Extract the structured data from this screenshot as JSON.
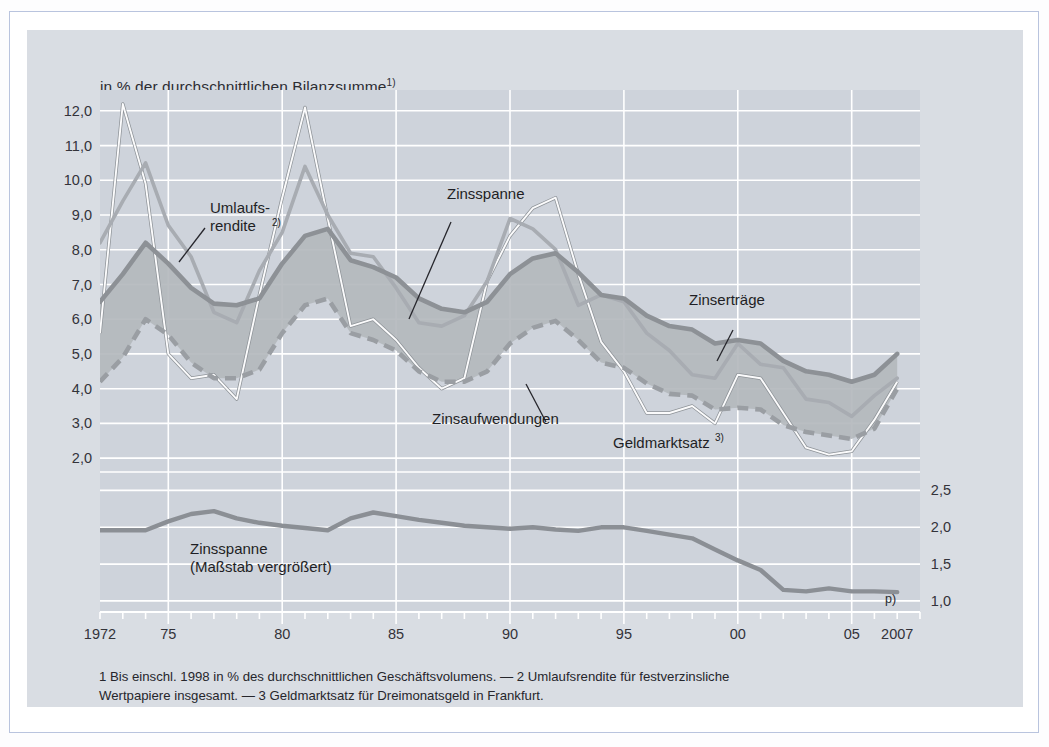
{
  "figure": {
    "title": "in % der durchschnittlichen Bilanzsumme",
    "title_sup": "1)",
    "p_flag": "p)",
    "footnote_line1": "1  Bis einschl. 1998 in % des durchschnittlichen Geschäftsvolumens. — 2 Umlaufsrendite für festverzinsliche",
    "footnote_line2": "Wertpapiere insgesamt. — 3 Geldmarktsatz für Dreimonatsgeld in Frankfurt.",
    "colors": {
      "panel_background": "#d9dde3",
      "plot_background": "#ced3db",
      "grid": "#ffffff",
      "band_fill": "#b4b8bd",
      "zinsertraege": "#8d9196",
      "zinsaufwendungen": "#9a9ea3",
      "umlaufsrendite": "#a8acb2",
      "geldmarktsatz": "#fbfbfc",
      "zinsspanne_lower": "#8b8f95",
      "text": "#26262c",
      "frame": "#b9c4de"
    }
  },
  "annotations": [
    {
      "name": "umlaufsrendite",
      "line1": "Umlaufs-",
      "line2": "rendite",
      "sup": "2)"
    },
    {
      "name": "zinsspanne",
      "label": "Zinsspanne"
    },
    {
      "name": "zinsertraege",
      "label": "Zinserträge"
    },
    {
      "name": "zinsaufwendungen",
      "label": "Zinsaufwendungen"
    },
    {
      "name": "geldmarktsatz",
      "label": "Geldmarktsatz",
      "sup": "3)"
    },
    {
      "name": "zinsspanne-lower",
      "line1": "Zinsspanne",
      "line2": "(Maßstab vergrößert)"
    }
  ],
  "chart_data": {
    "type": "line",
    "xlabel": "",
    "ylabel": "in % der durchschnittlichen Bilanzsumme",
    "grid": true,
    "legend_position": "inline-annotations",
    "xlim": [
      1972,
      2007
    ],
    "ylim": [
      1.6,
      12.6
    ],
    "ylim_right": [
      0.85,
      2.75
    ],
    "x_tick_labels": [
      {
        "x": 1972,
        "label": "1972"
      },
      {
        "x": 1975,
        "label": "75"
      },
      {
        "x": 1980,
        "label": "80"
      },
      {
        "x": 1985,
        "label": "85"
      },
      {
        "x": 1990,
        "label": "90"
      },
      {
        "x": 1995,
        "label": "95"
      },
      {
        "x": 2000,
        "label": "00"
      },
      {
        "x": 2005,
        "label": "05"
      },
      {
        "x": 2007,
        "label": "2007"
      }
    ],
    "y_tick_labels": [
      "12,0",
      "11,0",
      "10,0",
      "9,0",
      "8,0",
      "7,0",
      "6,0",
      "5,0",
      "4,0",
      "3,0",
      "2,0"
    ],
    "y_ticks": [
      12.0,
      11.0,
      10.0,
      9.0,
      8.0,
      7.0,
      6.0,
      5.0,
      4.0,
      3.0,
      2.0
    ],
    "y_right_tick_labels": [
      "2,5",
      "2,0",
      "1,5",
      "1,0"
    ],
    "y_right_ticks": [
      2.5,
      2.0,
      1.5,
      1.0
    ],
    "x": [
      1972,
      1973,
      1974,
      1975,
      1976,
      1977,
      1978,
      1979,
      1980,
      1981,
      1982,
      1983,
      1984,
      1985,
      1986,
      1987,
      1988,
      1989,
      1990,
      1991,
      1992,
      1993,
      1994,
      1995,
      1996,
      1997,
      1998,
      1999,
      2000,
      2001,
      2002,
      2003,
      2004,
      2005,
      2006,
      2007
    ],
    "series": [
      {
        "name": "Zinserträge",
        "style": "solid-thick",
        "color": "#8d9196",
        "values": [
          6.5,
          7.3,
          8.2,
          7.6,
          6.9,
          6.45,
          6.4,
          6.6,
          7.6,
          8.4,
          8.6,
          7.7,
          7.5,
          7.2,
          6.6,
          6.3,
          6.2,
          6.5,
          7.3,
          7.75,
          7.9,
          7.35,
          6.7,
          6.6,
          6.1,
          5.8,
          5.7,
          5.3,
          5.4,
          5.3,
          4.8,
          4.5,
          4.4,
          4.2,
          4.4,
          5.0
        ]
      },
      {
        "name": "Zinsaufwendungen",
        "style": "dashed-thick",
        "color": "#9a9ea3",
        "values": [
          4.2,
          4.9,
          6.0,
          5.55,
          4.75,
          4.3,
          4.3,
          4.55,
          5.6,
          6.4,
          6.6,
          5.6,
          5.4,
          5.1,
          4.5,
          4.2,
          4.2,
          4.5,
          5.3,
          5.75,
          5.95,
          5.4,
          4.75,
          4.6,
          4.15,
          3.85,
          3.8,
          3.4,
          3.45,
          3.4,
          2.95,
          2.75,
          2.65,
          2.55,
          2.85,
          4.0
        ]
      },
      {
        "name": "Umlaufsrendite",
        "style": "solid-medium",
        "color": "#a8acb2",
        "values": [
          8.2,
          9.4,
          10.5,
          8.7,
          7.8,
          6.2,
          5.9,
          7.4,
          8.5,
          10.4,
          9.0,
          7.9,
          7.8,
          6.9,
          5.9,
          5.8,
          6.1,
          7.1,
          8.9,
          8.6,
          8.0,
          6.4,
          6.7,
          6.5,
          5.6,
          5.1,
          4.4,
          4.3,
          5.3,
          4.7,
          4.6,
          3.7,
          3.6,
          3.2,
          3.8,
          4.3
        ]
      },
      {
        "name": "Geldmarktsatz",
        "style": "outline-thin",
        "color": "#fbfbfc",
        "values": [
          5.6,
          12.2,
          9.9,
          5.0,
          4.3,
          4.4,
          3.7,
          6.7,
          9.5,
          12.1,
          8.9,
          5.8,
          6.0,
          5.4,
          4.6,
          4.0,
          4.3,
          7.1,
          8.4,
          9.2,
          9.5,
          7.3,
          5.35,
          4.5,
          3.3,
          3.3,
          3.5,
          3.0,
          4.4,
          4.3,
          3.3,
          2.3,
          2.1,
          2.2,
          3.1,
          4.2
        ]
      },
      {
        "name": "Zinsspanne (Maßstab vergrößert)",
        "axis": "right",
        "style": "solid-thick",
        "color": "#8b8f95",
        "values": [
          1.96,
          1.96,
          1.96,
          2.08,
          2.18,
          2.22,
          2.12,
          2.06,
          2.02,
          1.99,
          1.96,
          2.12,
          2.2,
          2.15,
          2.1,
          2.06,
          2.02,
          2.0,
          1.98,
          2.0,
          1.97,
          1.95,
          2.0,
          2.0,
          1.95,
          1.9,
          1.85,
          1.7,
          1.55,
          1.42,
          1.15,
          1.13,
          1.17,
          1.13,
          1.13,
          1.12
        ]
      }
    ]
  }
}
